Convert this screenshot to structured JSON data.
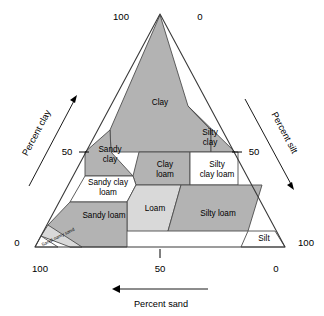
{
  "figure": {
    "background_color": "#ffffff",
    "fill_gray": "#b3b3b3",
    "fill_light": "#d9d9d9",
    "fill_white": "#ffffff",
    "stroke_color": "#4d4d4d"
  },
  "axes": {
    "clay": {
      "title": "Percent clay",
      "arrow_direction": "up-right",
      "ticks": [
        {
          "label": "100",
          "position": "apex-left"
        },
        {
          "label": "50",
          "position": "left-mid"
        },
        {
          "label": "0",
          "position": "bottom-left"
        }
      ]
    },
    "silt": {
      "title": "Percent silt",
      "arrow_direction": "down-right",
      "ticks": [
        {
          "label": "0",
          "position": "apex-right"
        },
        {
          "label": "50",
          "position": "right-mid"
        },
        {
          "label": "100",
          "position": "bottom-right"
        }
      ]
    },
    "sand": {
      "title": "Percent sand",
      "arrow_direction": "left",
      "ticks": [
        {
          "label": "100",
          "position": "bottom-left"
        },
        {
          "label": "50",
          "position": "bottom-center"
        },
        {
          "label": "0",
          "position": "bottom-right"
        }
      ]
    }
  },
  "chart_data": {
    "type": "ternary-diagram",
    "axis_labels": [
      "Percent clay",
      "Percent silt",
      "Percent sand"
    ],
    "axis_ranges": {
      "clay": [
        0,
        100
      ],
      "silt": [
        0,
        100
      ],
      "sand": [
        0,
        100
      ]
    },
    "tick_labels": {
      "clay": [
        "0",
        "50",
        "100"
      ],
      "silt": [
        "0",
        "50",
        "100"
      ],
      "sand": [
        "0",
        "50",
        "100"
      ]
    },
    "grid": false,
    "legend": "none",
    "classes": [
      {
        "name": "Clay",
        "fill": "gray",
        "label_x": 160,
        "label_y": 103,
        "label_size": "normal",
        "vertices": [
          [
            160,
            15
          ],
          [
            110,
            130
          ],
          [
            111,
            152
          ],
          [
            211,
            152
          ],
          [
            211,
            130
          ],
          [
            188,
            106
          ]
        ]
      },
      {
        "name": "Silty\nclay",
        "fill": "gray",
        "label_x": 210,
        "label_y": 138,
        "label_size": "normal",
        "vertices": [
          [
            188,
            106
          ],
          [
            211,
            130
          ],
          [
            211,
            152
          ],
          [
            235,
            152
          ]
        ]
      },
      {
        "name": "Sandy\nclay",
        "fill": "gray",
        "label_x": 110,
        "label_y": 155,
        "label_size": "normal",
        "vertices": [
          [
            110,
            130
          ],
          [
            85,
            152
          ],
          [
            85,
            176
          ],
          [
            133,
            176
          ],
          [
            111,
            152
          ]
        ]
      },
      {
        "name": "Clay\nloam",
        "fill": "gray",
        "label_x": 165,
        "label_y": 170,
        "label_size": "normal",
        "vertices": [
          [
            139,
            152
          ],
          [
            133,
            176
          ],
          [
            136,
            185
          ],
          [
            190,
            185
          ],
          [
            190,
            152
          ]
        ]
      },
      {
        "name": "Silty\nclay loam",
        "fill": "white",
        "label_x": 217,
        "label_y": 170,
        "label_size": "normal",
        "vertices": [
          [
            190,
            152
          ],
          [
            190,
            185
          ],
          [
            238,
            185
          ],
          [
            238,
            152
          ]
        ]
      },
      {
        "name": "Sandy clay\nloam",
        "fill": "white",
        "label_x": 108,
        "label_y": 188,
        "label_size": "normal",
        "vertices": [
          [
            85,
            176
          ],
          [
            70,
            202
          ],
          [
            127,
            202
          ],
          [
            136,
            185
          ],
          [
            133,
            176
          ]
        ]
      },
      {
        "name": "Loam",
        "fill": "light",
        "label_x": 155,
        "label_y": 209,
        "label_size": "normal",
        "vertices": [
          [
            136,
            185
          ],
          [
            127,
            202
          ],
          [
            127,
            231
          ],
          [
            168,
            231
          ],
          [
            181,
            185
          ]
        ]
      },
      {
        "name": "Silty loam",
        "fill": "gray",
        "label_x": 218,
        "label_y": 214,
        "label_size": "normal",
        "vertices": [
          [
            181,
            185
          ],
          [
            168,
            231
          ],
          [
            248,
            231
          ],
          [
            262,
            185
          ]
        ]
      },
      {
        "name": "Silt",
        "fill": "white",
        "label_x": 264,
        "label_y": 239,
        "label_size": "normal",
        "vertices": [
          [
            248,
            231
          ],
          [
            241,
            247
          ],
          [
            285,
            247
          ],
          [
            275,
            231
          ]
        ]
      },
      {
        "name": "Sandy loam",
        "fill": "gray",
        "label_x": 104,
        "label_y": 216,
        "label_size": "normal",
        "vertices": [
          [
            70,
            202
          ],
          [
            48,
            225
          ],
          [
            70,
            247
          ],
          [
            127,
            247
          ],
          [
            127,
            202
          ]
        ]
      },
      {
        "name": "Loamy sand",
        "fill": "light",
        "label_x": 63,
        "label_y": 235,
        "label_size": "tiny",
        "vertices": [
          [
            48,
            225
          ],
          [
            41,
            236
          ],
          [
            70,
            247
          ],
          [
            82,
            247
          ]
        ]
      },
      {
        "name": "Sand",
        "fill": "white",
        "label_x": 47,
        "label_y": 243,
        "label_size": "tiny",
        "vertices": [
          [
            41,
            236
          ],
          [
            35,
            247
          ],
          [
            58,
            247
          ]
        ]
      }
    ]
  }
}
